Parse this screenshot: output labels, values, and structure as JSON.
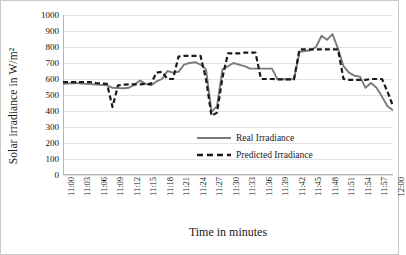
{
  "chart_data": {
    "type": "line",
    "title": "",
    "xlabel": "Time in minutes",
    "ylabel": "Solar irradiance in W/m²",
    "ylim": [
      0,
      1000
    ],
    "ytick_step": 100,
    "yticks": [
      1000,
      900,
      800,
      700,
      600,
      500,
      400,
      300,
      200,
      100,
      0
    ],
    "grid": true,
    "legend_position": "inside-lower-right",
    "categories": [
      "11:00",
      "11:01",
      "11:02",
      "11:03",
      "11:04",
      "11:05",
      "11:06",
      "11:07",
      "11:08",
      "11:09",
      "11:10",
      "11:11",
      "11:12",
      "11:13",
      "11:14",
      "11:15",
      "11:16",
      "11:17",
      "11:18",
      "11:19",
      "11:20",
      "11:21",
      "11:22",
      "11:23",
      "11:24",
      "11:25",
      "11:26",
      "11:27",
      "11:28",
      "11:29",
      "11:30",
      "11:31",
      "11:32",
      "11:33",
      "11:34",
      "11:35",
      "11:36",
      "11:37",
      "11:38",
      "11:39",
      "11:40",
      "11:41",
      "11:42",
      "11:43",
      "11:44",
      "11:45",
      "11:46",
      "11:47",
      "11:48",
      "11:49",
      "11:50",
      "11:51",
      "11:52",
      "11:53",
      "11:54",
      "11:55",
      "11:56",
      "11:57",
      "11:58",
      "11:59",
      "12:00"
    ],
    "xtick_labels": [
      "11:00",
      "11:03",
      "11:06",
      "11:09",
      "11:12",
      "11:15",
      "11:18",
      "11:21",
      "11:24",
      "11:27",
      "11:30",
      "11:33",
      "11:36",
      "11:39",
      "11:42",
      "11:45",
      "11:48",
      "11:51",
      "11:54",
      "11:57",
      "12:00"
    ],
    "series": [
      {
        "name": "Real Irradiance",
        "style": "solid",
        "color": "#7a7a7a",
        "values": [
          570,
          572,
          575,
          573,
          570,
          568,
          566,
          563,
          560,
          545,
          543,
          542,
          545,
          565,
          590,
          570,
          560,
          585,
          600,
          650,
          640,
          645,
          690,
          700,
          705,
          690,
          660,
          395,
          430,
          660,
          680,
          700,
          690,
          680,
          665,
          665,
          665,
          665,
          665,
          598,
          598,
          598,
          600,
          770,
          775,
          780,
          800,
          870,
          845,
          880,
          790,
          680,
          640,
          620,
          615,
          545,
          575,
          545,
          490,
          430,
          405
        ]
      },
      {
        "name": "Predicted Irradiance",
        "style": "dashed",
        "color": "#1a1a1a",
        "values": [
          580,
          580,
          580,
          580,
          580,
          580,
          575,
          572,
          570,
          425,
          560,
          565,
          566,
          566,
          566,
          570,
          570,
          640,
          645,
          600,
          600,
          740,
          745,
          745,
          745,
          745,
          600,
          370,
          390,
          610,
          760,
          760,
          760,
          765,
          765,
          765,
          600,
          600,
          600,
          598,
          598,
          598,
          598,
          785,
          785,
          785,
          785,
          785,
          785,
          785,
          785,
          600,
          595,
          595,
          595,
          595,
          600,
          600,
          600,
          520,
          430
        ]
      }
    ]
  },
  "legend": {
    "entries": [
      {
        "label": "Real Irradiance"
      },
      {
        "label": "Predicted Irradiance"
      }
    ]
  }
}
